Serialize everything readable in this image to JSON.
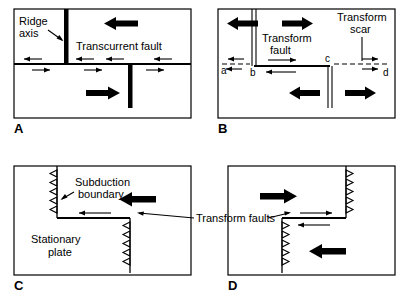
{
  "figure": {
    "title": "",
    "background_color": "#ffffff",
    "ink_color": "#000000",
    "panel_count": 4
  },
  "panels": [
    {
      "id": "A",
      "label": "A",
      "caption_labels": {
        "ridge_axis": "Ridge\naxis",
        "ridge_axis_line1": "Ridge",
        "ridge_axis_line2": "axis",
        "transcurrent_fault": "Transcurrent  fault"
      },
      "features": [
        {
          "name": "ridge-axis-upper",
          "type": "ridge-thick-bar",
          "style": "solid-black-bar"
        },
        {
          "name": "ridge-axis-lower",
          "type": "ridge-thick-bar",
          "style": "solid-black-bar"
        },
        {
          "name": "transcurrent-fault",
          "type": "horizontal-fault",
          "style": "thick-line"
        },
        {
          "name": "plate-motion-upper",
          "type": "bold-arrow",
          "direction": "left"
        },
        {
          "name": "plate-motion-lower",
          "type": "bold-arrow",
          "direction": "right"
        }
      ],
      "slip_arrows": {
        "above_fault_direction": "left",
        "below_fault_direction": "right",
        "above_count": 4,
        "below_count": 4
      }
    },
    {
      "id": "B",
      "label": "B",
      "caption_labels": {
        "transform_fault_line1": "Transform",
        "transform_fault_line2": "fault",
        "transform_scar_line1": "Transform",
        "transform_scar_line2": "scar"
      },
      "point_labels": [
        "a",
        "b",
        "c",
        "d"
      ],
      "features": [
        {
          "name": "ridge-axis-upper",
          "type": "ridge-double-line",
          "style": "double-thin-line"
        },
        {
          "name": "ridge-axis-lower",
          "type": "ridge-double-line",
          "style": "double-thin-line"
        },
        {
          "name": "transform-fault",
          "type": "horizontal-fault",
          "style": "thick-line"
        },
        {
          "name": "transform-scar-left",
          "type": "dashed-scar",
          "style": "dashed-line"
        },
        {
          "name": "transform-scar-right",
          "type": "dashed-scar",
          "style": "dashed-line"
        },
        {
          "name": "plate-motion-upper-left",
          "type": "bold-arrow",
          "direction": "left"
        },
        {
          "name": "plate-motion-upper-right",
          "type": "bold-arrow",
          "direction": "right"
        },
        {
          "name": "plate-motion-lower-left",
          "type": "bold-arrow",
          "direction": "left"
        },
        {
          "name": "plate-motion-lower-right",
          "type": "bold-arrow",
          "direction": "right"
        }
      ],
      "slip_arrows": {
        "above_fault_direction": "right",
        "below_fault_direction": "left",
        "scar_left_direction": "left",
        "scar_right_direction": "right"
      }
    },
    {
      "id": "C",
      "label": "C",
      "caption_labels": {
        "subduction_boundary_line1": "Subduction",
        "subduction_boundary_line2": "boundary",
        "stationary_plate_line1": "Stationary",
        "stationary_plate_line2": "plate"
      },
      "features": [
        {
          "name": "subduction-boundary-upper",
          "type": "subduction-teeth",
          "teeth_direction": "left",
          "teeth_count": 5
        },
        {
          "name": "subduction-boundary-lower",
          "type": "subduction-teeth",
          "teeth_direction": "left",
          "teeth_count": 5
        },
        {
          "name": "transform-fault",
          "type": "horizontal-fault",
          "style": "thick-line"
        },
        {
          "name": "plate-motion",
          "type": "bold-arrow",
          "direction": "left"
        }
      ],
      "slip_arrows": {
        "fault_direction": "left",
        "count": 1
      }
    },
    {
      "id": "D",
      "label": "D",
      "caption_labels": {},
      "features": [
        {
          "name": "subduction-boundary-upper",
          "type": "subduction-teeth",
          "teeth_direction": "right",
          "teeth_count": 5
        },
        {
          "name": "subduction-boundary-lower",
          "type": "subduction-teeth",
          "teeth_direction": "right",
          "teeth_count": 5
        },
        {
          "name": "transform-fault",
          "type": "horizontal-fault",
          "style": "thick-line"
        },
        {
          "name": "plate-motion-upper",
          "type": "bold-arrow",
          "direction": "right"
        },
        {
          "name": "plate-motion-lower",
          "type": "bold-arrow",
          "direction": "left"
        }
      ],
      "slip_arrows": {
        "above_fault_direction": "right",
        "below_fault_direction": "left"
      }
    }
  ],
  "shared_labels": {
    "transform_faults": "Transform  faults"
  }
}
